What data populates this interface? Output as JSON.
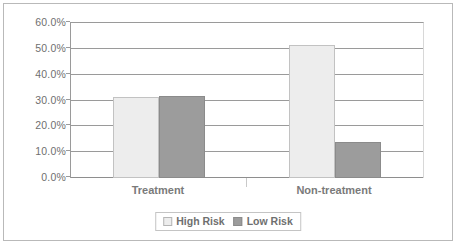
{
  "chart_data": {
    "type": "bar",
    "title": "",
    "xlabel": "",
    "ylabel": "",
    "ylim": [
      0,
      60
    ],
    "grid": true,
    "legend_position": "bottom-center",
    "categories": [
      "Treatment",
      "Non-treatment"
    ],
    "ytick_labels": [
      "60.0%",
      "50.0%",
      "40.0%",
      "30.0%",
      "20.0%",
      "10.0%",
      "0.0%"
    ],
    "ytick_values": [
      60,
      50,
      40,
      30,
      20,
      10,
      0
    ],
    "series": [
      {
        "name": "High Risk",
        "color": "#ededed",
        "values": [
          31.2,
          51.5
        ]
      },
      {
        "name": "Low Risk",
        "color": "#9c9c9c",
        "values": [
          31.6,
          13.8
        ]
      }
    ]
  },
  "legend": {
    "items": [
      {
        "label": "High Risk"
      },
      {
        "label": "Low Risk"
      }
    ]
  },
  "colors": {
    "high_risk": "#ededed",
    "low_risk": "#9c9c9c",
    "gridline": "#9a9a9a",
    "text": "#6f6f6f",
    "border": "#b9b9b9"
  }
}
